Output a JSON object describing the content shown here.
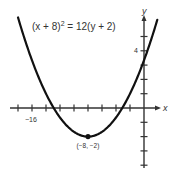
{
  "chart_data": {
    "type": "line",
    "title": "",
    "equation": "(x + 8)² = 12(y + 2)",
    "equation_parts": {
      "lhs": "(x + 8)",
      "exp": "2",
      "rhs": " = 12(y + 2)"
    },
    "xlabel": "x",
    "ylabel": "y",
    "x_tick_step": 2,
    "y_tick_step": 1,
    "x_tick_labels": [
      {
        "value": -16,
        "label": "−16"
      }
    ],
    "y_tick_labels": [
      {
        "value": 4,
        "label": "4"
      }
    ],
    "xlim": [
      -19.3,
      2.3
    ],
    "ylim": [
      -4.2,
      6.3
    ],
    "grid": false,
    "legend": null,
    "series": [
      {
        "name": "parabola",
        "formula": "y = (x + 8)^2 / 12 - 2",
        "x": [
          -18,
          -16,
          -14,
          -12,
          -10,
          -8,
          -6,
          -4,
          -2,
          0,
          1.9
        ],
        "y": [
          6.33,
          3.33,
          1.0,
          -0.67,
          -1.67,
          -2.0,
          -1.67,
          -0.67,
          1.0,
          3.33,
          6.17
        ]
      }
    ],
    "annotations": [
      {
        "type": "point",
        "x": -8,
        "y": -2,
        "label": "(−8, −2)"
      }
    ]
  }
}
